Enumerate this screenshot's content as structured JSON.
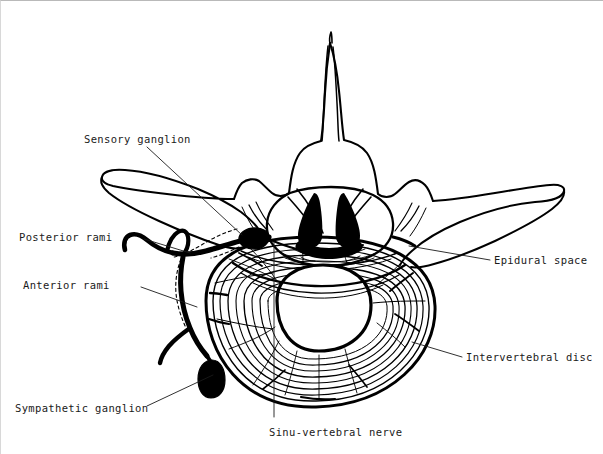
{
  "figure": {
    "view": "axial / superior view",
    "style": "black-and-white line drawing",
    "background_color": "#ffffff",
    "ink_color": "#000000",
    "label_color": "#1a1a1a"
  },
  "labels": [
    {
      "id": "sensory-ganglion",
      "text": "Sensory ganglion",
      "text_x": 83,
      "text_y": 132,
      "leader": [
        [
          146,
          146
        ],
        [
          241,
          234
        ]
      ]
    },
    {
      "id": "posterior-rami",
      "text": "Posterior rami",
      "text_x": 18,
      "text_y": 230,
      "leader": [
        [
          143,
          238
        ],
        [
          189,
          252
        ]
      ]
    },
    {
      "id": "anterior-rami",
      "text": "Anterior rami",
      "text_x": 22,
      "text_y": 278,
      "leader": [
        [
          140,
          286
        ],
        [
          196,
          306
        ]
      ]
    },
    {
      "id": "sympathetic-ganglion",
      "text": "Sympathetic ganglion",
      "text_x": 14,
      "text_y": 401,
      "leader": [
        [
          146,
          405
        ],
        [
          212,
          374
        ]
      ]
    },
    {
      "id": "sinu-vertebral-nerve",
      "text": "Sinu-vertebral nerve",
      "text_x": 268,
      "text_y": 425,
      "leader": [
        [
          273,
          241
        ],
        [
          273,
          416
        ]
      ]
    },
    {
      "id": "epidural-space",
      "text": "Epidural space",
      "text_x": 493,
      "text_y": 253,
      "leader": [
        [
          489,
          259
        ],
        [
          408,
          245
        ]
      ]
    },
    {
      "id": "intervertebral-disc",
      "text": "Intervertebral disc",
      "text_x": 465,
      "text_y": 350,
      "leader": [
        [
          461,
          356
        ],
        [
          411,
          341
        ]
      ]
    }
  ],
  "anatomy": {
    "spinous_process": "posterior midline projection, bifid tip",
    "laminae": "paired posterior arch plates",
    "transverse_process_left": "elongated lateral wing, left side",
    "transverse_process_right": "elongated lateral wing, right side",
    "vertebral_canal": "oval central canal containing dural sac and cauda equina",
    "dural_sac": "rounded sac inside vertebral canal",
    "nerve_roots": "paired roots crossing within the canal",
    "annulus_fibrosus": "concentric lamellar rings of the disc",
    "nucleus_pulposus": "central oval clear zone of the disc",
    "spinal_nerve": "thick nerve trunk exiting laterally",
    "sensory_ganglion_body": "solid dark oval on the dorsal root",
    "sympathetic_ganglion_body": "solid dark oval anterolateral to the disc",
    "sinu_vertebral_branch": "recurrent branch re-entering the canal"
  }
}
